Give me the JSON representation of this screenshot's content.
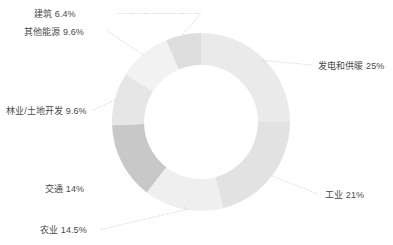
{
  "chart_data": {
    "type": "pie",
    "variant": "donut",
    "title": "",
    "subtitle": "",
    "xlabel": "",
    "ylabel": "",
    "legend_position": "none",
    "grid": false,
    "value_unit": "%",
    "categories": [
      "发电和供暖",
      "工业",
      "农业",
      "交通",
      "林业/土地开发",
      "其他能源",
      "建筑"
    ],
    "values": [
      25,
      21,
      14.5,
      14,
      9.6,
      9.6,
      6.4
    ],
    "labels": [
      "发电和供暖 25%",
      "工业 21%",
      "农业 14.5%",
      "交通 14%",
      "林业/土地开发 9.6%",
      "其他能源 9.6%",
      "建筑 6.4%"
    ],
    "colors": [
      "#eaeaea",
      "#e2e2e2",
      "#efefef",
      "#c8c8c8",
      "#e6e6e6",
      "#f2f2f2",
      "#dedede"
    ],
    "start_angle_deg": 0,
    "direction": "clockwise",
    "center": [
      201,
      122
    ],
    "outer_radius": 89,
    "inner_radius": 57,
    "leader_line_color": "#c0c0c0",
    "label_color": "#4a4a4a",
    "background": "#ffffff",
    "slices": [
      {
        "name": "建筑",
        "value": 6.4,
        "label": "建筑 6.4%",
        "color": "#dedede",
        "side": "left",
        "label_x": 34,
        "label_y": 9,
        "has_leader": true
      },
      {
        "name": "其他能源",
        "value": 9.6,
        "label": "其他能源 9.6%",
        "color": "#f2f2f2",
        "side": "left",
        "label_x": 24,
        "label_y": 27,
        "has_leader": true
      },
      {
        "name": "林业/土地开发",
        "value": 9.6,
        "label": "林业/土地开发 9.6%",
        "color": "#e6e6e6",
        "side": "left",
        "label_x": 6,
        "label_y": 106,
        "has_leader": true
      },
      {
        "name": "交通",
        "value": 14,
        "label": "交通 14%",
        "color": "#c8c8c8",
        "side": "left",
        "label_x": 45,
        "label_y": 184,
        "has_leader": false
      },
      {
        "name": "农业",
        "value": 14.5,
        "label": "农业 14.5%",
        "color": "#efefef",
        "side": "left",
        "label_x": 40,
        "label_y": 225,
        "has_leader": true
      },
      {
        "name": "工业",
        "value": 21,
        "label": "工业 21%",
        "color": "#e2e2e2",
        "side": "right",
        "label_x": 325,
        "label_y": 190,
        "has_leader": true
      },
      {
        "name": "发电和供暖",
        "value": 25,
        "label": "发电和供暖 25%",
        "color": "#eaeaea",
        "side": "right",
        "label_x": 318,
        "label_y": 61,
        "has_leader": true
      }
    ]
  }
}
